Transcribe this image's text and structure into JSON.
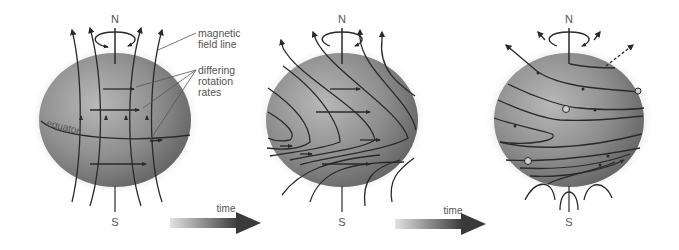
{
  "diagram": {
    "title": "",
    "colors": {
      "globe_light": "#b4b4b4",
      "globe_mid": "#8a8a8a",
      "globe_dark": "#5c5c5c",
      "field_line": "#2a2a2a",
      "label_text": "#555555",
      "arrow_dark": "#3c3c3c",
      "arrow_light": "#d8d8d8"
    },
    "panels": [
      {
        "id": "stage-1",
        "north_label": "N",
        "south_label": "S",
        "equator_label": "equator",
        "annotations": [
          {
            "text_lines": [
              "magnetic",
              "field line"
            ]
          },
          {
            "text_lines": [
              "differing",
              "rotation",
              "rates"
            ]
          }
        ]
      },
      {
        "id": "stage-2",
        "north_label": "N",
        "south_label": "S"
      },
      {
        "id": "stage-3",
        "north_label": "N",
        "south_label": "S"
      }
    ],
    "time_arrows": [
      {
        "label": "time"
      },
      {
        "label": "time"
      }
    ]
  }
}
